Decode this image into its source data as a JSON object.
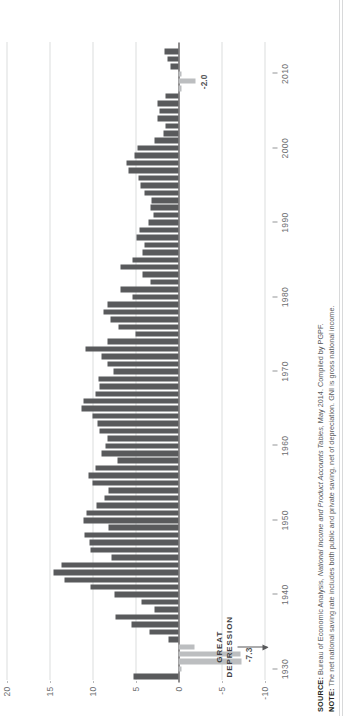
{
  "figure": {
    "orientation": "rotated-90",
    "background": "#ffffff",
    "colors": {
      "bar_positive": "#595a5c",
      "bar_negative": "#bcbec0",
      "zero_line": "#231f20",
      "gridline": "#b9babc",
      "text": "#6d6e70"
    }
  },
  "annotations": {
    "great_depression": {
      "line1": "GREAT",
      "line2": "DEPRESSION",
      "points_to_year": 1933
    },
    "labels": [
      {
        "text": "-7.3",
        "year": 1932
      },
      {
        "text": "-2.0",
        "year": 2009
      }
    ]
  },
  "footer": {
    "source_label": "SOURCE:",
    "source_text_pre": " Bureau of Economic Analysis, ",
    "source_text_italic": "National Income and Product Accounts Tables",
    "source_text_post": ", May 2014. Compiled by PGPF.",
    "note_label": "NOTE:",
    "note_text": " The net national saving rate includes both public and private saving, net of depreciation. GNI is gross national income."
  },
  "chart_data": {
    "type": "bar",
    "title": "",
    "subtitle": "",
    "xlabel": "",
    "ylabel": "",
    "ylim": [
      -10,
      20
    ],
    "yticks": [
      20,
      15,
      10,
      5,
      0,
      -5,
      -10
    ],
    "ytick_labels": [
      "20",
      "15",
      "10",
      "5",
      "0",
      "-5",
      "-10"
    ],
    "xticks": [
      1930,
      1940,
      1950,
      1960,
      1970,
      1980,
      1990,
      2000,
      2010
    ],
    "xtick_labels": [
      "1930",
      "1940",
      "1950",
      "1960",
      "1970",
      "1980",
      "1990",
      "2000",
      "2010"
    ],
    "xlim": [
      1928.2,
      2014.2
    ],
    "grid": "horizontal-dotted",
    "legend": null,
    "series": [
      {
        "name": "Net national saving rate (% of GNI)",
        "color_positive": "#595a5c",
        "color_negative": "#bcbec0"
      }
    ],
    "x": [
      1929,
      1930,
      1931,
      1932,
      1933,
      1934,
      1935,
      1936,
      1937,
      1938,
      1939,
      1940,
      1941,
      1942,
      1943,
      1944,
      1945,
      1946,
      1947,
      1948,
      1949,
      1950,
      1951,
      1952,
      1953,
      1954,
      1955,
      1956,
      1957,
      1958,
      1959,
      1960,
      1961,
      1962,
      1963,
      1964,
      1965,
      1966,
      1967,
      1968,
      1969,
      1970,
      1971,
      1972,
      1973,
      1974,
      1975,
      1976,
      1977,
      1978,
      1979,
      1980,
      1981,
      1982,
      1983,
      1984,
      1985,
      1986,
      1987,
      1988,
      1989,
      1990,
      1991,
      1992,
      1993,
      1994,
      1995,
      1996,
      1997,
      1998,
      1999,
      2000,
      2001,
      2002,
      2003,
      2004,
      2005,
      2006,
      2007,
      2008,
      2009,
      2010,
      2011,
      2012,
      2013
    ],
    "values": [
      5.2,
      -0.3,
      -7.3,
      -7.2,
      -1.9,
      1.2,
      3.4,
      5.5,
      7.3,
      2.8,
      4.3,
      7.5,
      10.2,
      13.3,
      14.5,
      13.6,
      7.8,
      10.2,
      10.4,
      10.9,
      8.1,
      11.0,
      10.7,
      9.5,
      8.6,
      8.1,
      10.0,
      10.5,
      9.6,
      7.1,
      9.0,
      8.5,
      8.2,
      9.2,
      9.4,
      10.0,
      11.3,
      11.1,
      9.7,
      9.2,
      9.3,
      7.6,
      8.3,
      8.9,
      10.8,
      8.3,
      5.0,
      7.0,
      7.9,
      8.7,
      8.3,
      5.4,
      6.7,
      3.3,
      4.2,
      6.8,
      5.4,
      4.2,
      4.0,
      4.9,
      4.5,
      3.5,
      2.9,
      3.2,
      3.1,
      3.9,
      4.4,
      4.7,
      5.8,
      6.1,
      5.1,
      4.8,
      2.8,
      1.8,
      1.5,
      2.5,
      2.2,
      2.5,
      1.5,
      -0.4,
      -2.0,
      -0.3,
      0.9,
      1.3,
      1.6
    ]
  }
}
